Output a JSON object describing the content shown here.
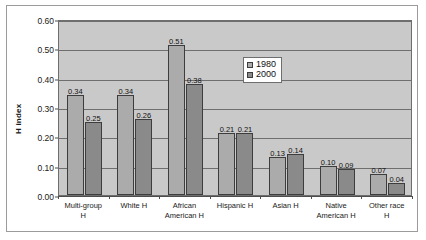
{
  "chart_data": {
    "type": "bar",
    "title": "",
    "xlabel": "",
    "ylabel": "H index",
    "ylim": [
      0.0,
      0.6
    ],
    "ytick_labels": [
      "0.60",
      "0.50",
      "0.40",
      "0.30",
      "0.20",
      "0.10",
      "0.00"
    ],
    "ytick_values": [
      0.6,
      0.5,
      0.4,
      0.3,
      0.2,
      0.1,
      0.0
    ],
    "grid": true,
    "legend_position": "center-right-inside",
    "categories": [
      "Multi-group H",
      "White H",
      "African American H",
      "Hispanic H",
      "Asian H",
      "Native American H",
      "Other race H"
    ],
    "category_lines": [
      [
        "Multi-group",
        "H"
      ],
      [
        "White H"
      ],
      [
        "African",
        "American H"
      ],
      [
        "Hispanic H"
      ],
      [
        "Asian H"
      ],
      [
        "Native",
        "American H"
      ],
      [
        "Other race",
        "H"
      ]
    ],
    "series": [
      {
        "name": "1980",
        "color": "#ababab",
        "values": [
          0.34,
          0.34,
          0.51,
          0.21,
          0.13,
          0.1,
          0.07
        ],
        "labels": [
          "0.34",
          "0.34",
          "0.51",
          "0.21",
          "0.13",
          "0.10",
          "0.07"
        ]
      },
      {
        "name": "2000",
        "color": "#8a8a8a",
        "values": [
          0.25,
          0.26,
          0.38,
          0.21,
          0.14,
          0.09,
          0.04
        ],
        "labels": [
          "0.25",
          "0.26",
          "0.38",
          "0.21",
          "0.14",
          "0.09",
          "0.04"
        ]
      }
    ]
  },
  "legend": {
    "entries": [
      {
        "label": "1980"
      },
      {
        "label": "2000"
      }
    ]
  },
  "colors": {
    "series_1980": "#ababab",
    "series_2000": "#8a8a8a",
    "plot_background": "#c9c9c9",
    "gridline": "#6e6e6e",
    "bar_border": "#3d3d3d",
    "frame_border": "#9b9b9b"
  }
}
